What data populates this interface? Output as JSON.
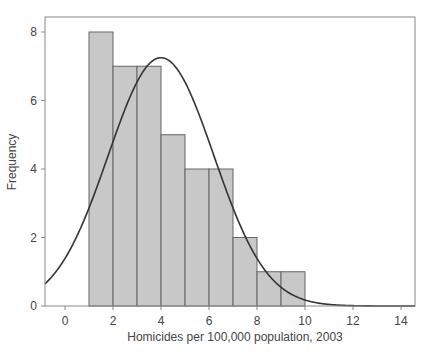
{
  "chart_data": {
    "type": "bar",
    "subtype": "histogram_with_normal_curve",
    "title": "",
    "xlabel": "Homicides per 100,000 population, 2003",
    "ylabel": "Frequency",
    "xlim": [
      -0.8,
      14.8
    ],
    "ylim": [
      0,
      8.4
    ],
    "xticks": [
      0,
      2,
      4,
      6,
      8,
      10,
      12,
      14
    ],
    "yticks": [
      0,
      2,
      4,
      6,
      8
    ],
    "grid": false,
    "legend": null,
    "bins": [
      {
        "start": 1,
        "end": 2,
        "count": 8
      },
      {
        "start": 2,
        "end": 3,
        "count": 7
      },
      {
        "start": 3,
        "end": 4,
        "count": 7
      },
      {
        "start": 4,
        "end": 5,
        "count": 5
      },
      {
        "start": 5,
        "end": 6,
        "count": 4
      },
      {
        "start": 6,
        "end": 7,
        "count": 4
      },
      {
        "start": 7,
        "end": 8,
        "count": 2
      },
      {
        "start": 8,
        "end": 9,
        "count": 1
      },
      {
        "start": 9,
        "end": 10,
        "count": 1
      }
    ],
    "normal_curve": {
      "mean": 4.0,
      "sd": 2.2,
      "peak": 7.25
    },
    "colors": {
      "bar_fill": "#c8c8c8",
      "bar_edge": "#666666",
      "curve": "#333333",
      "frame": "#888888"
    }
  }
}
